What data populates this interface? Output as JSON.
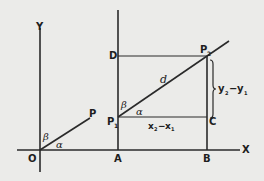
{
  "diagram": {
    "type": "coordinate-geometry",
    "axes": {
      "x_label": "X",
      "y_label": "Y",
      "origin_label": "O"
    },
    "points": {
      "P": "P",
      "P1": {
        "base": "P",
        "sub": "1"
      },
      "P2": {
        "base": "P",
        "sub": "2"
      },
      "A": "A",
      "B": "B",
      "C": "C",
      "D": "D"
    },
    "angles": {
      "alpha": "α",
      "beta": "β"
    },
    "distance_label": "d",
    "horizontal_diff": {
      "a": "x",
      "a_sub": "2",
      "minus": "−",
      "b": "x",
      "b_sub": "1"
    },
    "vertical_diff": {
      "a": "y",
      "a_sub": "2",
      "minus": "−",
      "b": "y",
      "b_sub": "1"
    }
  }
}
